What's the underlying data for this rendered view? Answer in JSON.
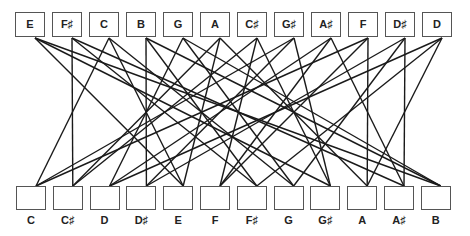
{
  "top_row": {
    "labels": [
      "E",
      "F♯",
      "C",
      "B",
      "G",
      "A",
      "C♯",
      "G♯",
      "A♯",
      "F",
      "D♯",
      "D"
    ]
  },
  "bottom_row": {
    "labels": [
      "C",
      "C♯",
      "D",
      "D♯",
      "E",
      "F",
      "F♯",
      "G",
      "G♯",
      "A",
      "A♯",
      "B"
    ]
  },
  "connections": [
    {
      "from": 0,
      "to": [
        4,
        8,
        11
      ]
    },
    {
      "from": 1,
      "to": [
        6,
        10,
        1
      ]
    },
    {
      "from": 2,
      "to": [
        0,
        4,
        7
      ]
    },
    {
      "from": 3,
      "to": [
        11,
        3,
        6
      ]
    },
    {
      "from": 4,
      "to": [
        7,
        11,
        2
      ]
    },
    {
      "from": 5,
      "to": [
        9,
        1,
        4
      ]
    },
    {
      "from": 6,
      "to": [
        1,
        5,
        8
      ]
    },
    {
      "from": 7,
      "to": [
        8,
        0,
        3
      ]
    },
    {
      "from": 8,
      "to": [
        10,
        2,
        5
      ]
    },
    {
      "from": 9,
      "to": [
        5,
        9,
        0
      ]
    },
    {
      "from": 10,
      "to": [
        3,
        7,
        10
      ]
    },
    {
      "from": 11,
      "to": [
        2,
        6,
        9
      ]
    }
  ],
  "colors": {
    "line": "#1a1a1a",
    "box_border": "#555555",
    "text": "#222222"
  }
}
